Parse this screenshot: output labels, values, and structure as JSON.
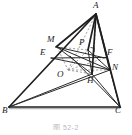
{
  "figure": {
    "caption": "图 52-2",
    "stroke_color": "#2b2b2b",
    "dashed_color": "#8a8a8a",
    "background_color": "#ffffff",
    "baseline_color": "#a8a8a8",
    "label_color": "#1a1a1a"
  },
  "points": {
    "A": {
      "label": "A",
      "x": 96,
      "y": 14,
      "label_x": 93,
      "label_y": 2
    },
    "B": {
      "label": "B",
      "x": 9,
      "y": 107,
      "label_x": 3,
      "label_y": 108
    },
    "C": {
      "label": "C",
      "x": 120,
      "y": 107,
      "label_x": 116,
      "label_y": 108
    },
    "M": {
      "label": "M",
      "x": 57,
      "y": 47,
      "label_x": 48,
      "label_y": 36
    },
    "E": {
      "label": "E",
      "x": 52,
      "y": 58,
      "label_x": 41,
      "label_y": 50
    },
    "F": {
      "label": "F",
      "x": 105,
      "y": 58,
      "label_x": 108,
      "label_y": 50
    },
    "N": {
      "label": "N",
      "x": 110,
      "y": 70,
      "label_x": 112,
      "label_y": 65
    },
    "P": {
      "label": "P",
      "x": 88,
      "y": 50,
      "label_x": 79,
      "label_y": 40
    },
    "O": {
      "label": "O",
      "x": 68,
      "y": 70,
      "label_x": 58,
      "label_y": 71
    },
    "H": {
      "label": "H",
      "x": 92,
      "y": 74,
      "label_x": 88,
      "label_y": 76
    }
  },
  "segments": [
    {
      "name": "side-AB",
      "from": "A",
      "to": "B",
      "style": "solid",
      "width": 1.5
    },
    {
      "name": "side-BC",
      "from": "B",
      "to": "C",
      "style": "solid",
      "width": 1.5
    },
    {
      "name": "side-AC",
      "from": "A",
      "to": "C",
      "style": "solid",
      "width": 1.5
    },
    {
      "name": "segment-AM",
      "from": "A",
      "to": "M",
      "style": "solid",
      "width": 1.5
    },
    {
      "name": "segment-AN",
      "from": "A",
      "to": "N",
      "style": "solid",
      "width": 1.5
    },
    {
      "name": "segment-AH",
      "from": "A",
      "to": "H",
      "style": "solid",
      "width": 1.5
    },
    {
      "name": "segment-EF",
      "from": "E",
      "to": "F",
      "style": "solid",
      "width": 1.2
    },
    {
      "name": "segment-MN",
      "from": "M",
      "to": "N",
      "style": "solid",
      "width": 1.2
    },
    {
      "name": "segment-MH",
      "from": "M",
      "to": "H",
      "style": "solid",
      "width": 1.2
    },
    {
      "name": "segment-BN",
      "from": "B",
      "to": "N",
      "style": "solid",
      "width": 1.2
    },
    {
      "name": "segment-BH",
      "from": "B",
      "to": "H",
      "style": "solid",
      "width": 1.2
    },
    {
      "name": "segment-CH",
      "from": "C",
      "to": "H",
      "style": "solid",
      "width": 1.2
    },
    {
      "name": "segment-CN",
      "from": "C",
      "to": "N",
      "style": "solid",
      "width": 1.2
    },
    {
      "name": "segment-CM",
      "from": "C",
      "to": "M",
      "style": "solid",
      "width": 1.2
    },
    {
      "name": "segment-EN",
      "from": "E",
      "to": "N",
      "style": "solid",
      "width": 1.2
    },
    {
      "name": "segment-AO",
      "from": "A",
      "to": "O",
      "style": "dashed",
      "width": 0.9
    },
    {
      "name": "segment-MO",
      "from": "M",
      "to": "O",
      "style": "dashed",
      "width": 0.9
    },
    {
      "name": "segment-ON",
      "from": "O",
      "to": "N",
      "style": "dashed",
      "width": 0.9
    },
    {
      "name": "segment-OH",
      "from": "O",
      "to": "H",
      "style": "dashed",
      "width": 0.9
    },
    {
      "name": "segment-AH-vertical",
      "from": "A",
      "to": "H",
      "style": "dashed",
      "width": 0.9
    },
    {
      "name": "segment-OP",
      "from": "O",
      "to": "P",
      "style": "dashed",
      "width": 0.9
    }
  ],
  "marks": {
    "right_angle_at_P": {
      "name": "right-angle-mark",
      "x": 91,
      "y": 50,
      "size": 4
    }
  }
}
